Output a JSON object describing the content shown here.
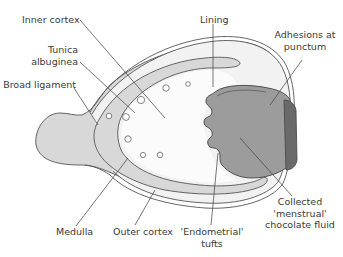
{
  "diagram": {
    "colors": {
      "outline": "#555555",
      "medulla_fill": "#d8d8d8",
      "cortex_fill": "#f4f4f4",
      "inner_fill": "#fafafa",
      "cyst_fill": "#999999",
      "adhesion_fill": "#6a6a6a",
      "leader_line": "#4a4a4a",
      "label_text": "#3a3a3a"
    },
    "labels": {
      "inner_cortex": "Inner cortex",
      "tunica_1": "Tunica",
      "tunica_2": "albuginea",
      "broad_ligament": "Broad ligament",
      "lining": "Lining",
      "adhesions_1": "Adhesions at",
      "adhesions_2": "punctum",
      "medulla": "Medulla",
      "outer_cortex": "Outer cortex",
      "endometrial_1": "'Endometrial'",
      "endometrial_2": "tufts",
      "collected_1": "Collected",
      "collected_2": "'menstrual'",
      "collected_3": "chocolate fluid"
    }
  }
}
